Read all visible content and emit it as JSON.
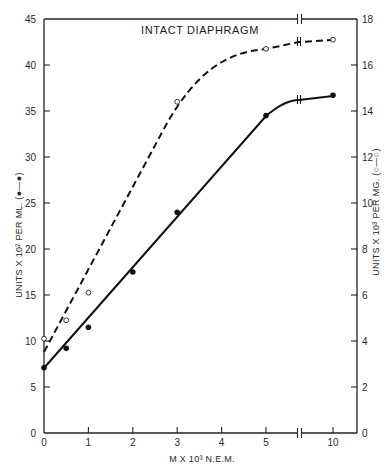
{
  "chart_data": {
    "type": "line",
    "title": "INTACT DIAPHRAGM",
    "xlabel": "M X 10³ N.E.M.",
    "ylabel_left": "UNITS X 10² PER ML. (●—●)",
    "ylabel_right": "UNITS X 10³ PER MG. (○—○)",
    "x_ticks": [
      "0",
      "1",
      "2",
      "3",
      "4",
      "5",
      "10"
    ],
    "x_axis_break": "between 5 and 10",
    "ylim_left": [
      0,
      45
    ],
    "y_ticks_left": [
      "0",
      "5",
      "10",
      "15",
      "20",
      "25",
      "30",
      "35",
      "40",
      "45"
    ],
    "ylim_right": [
      0,
      18
    ],
    "y_ticks_right": [
      "0",
      "2",
      "4",
      "6",
      "8",
      "10",
      "12",
      "14",
      "16",
      "18"
    ],
    "grid": false,
    "legend": "embedded in axis labels",
    "series": [
      {
        "name": "Units x 10² per ml (filled circles, solid line)",
        "axis": "left",
        "marker": "filled-circle",
        "line": "solid",
        "x": [
          0,
          0.5,
          1,
          2,
          3,
          5,
          10
        ],
        "values": [
          7.1,
          9.2,
          11.5,
          17.5,
          24.0,
          34.5,
          36.7
        ]
      },
      {
        "name": "Units x 10³ per mg (open circles, dashed line)",
        "axis": "right",
        "marker": "open-circle",
        "line": "dashed",
        "x": [
          0,
          0.5,
          1,
          3,
          5,
          10
        ],
        "values": [
          4.1,
          4.9,
          6.1,
          14.4,
          16.7,
          17.1
        ]
      }
    ]
  }
}
